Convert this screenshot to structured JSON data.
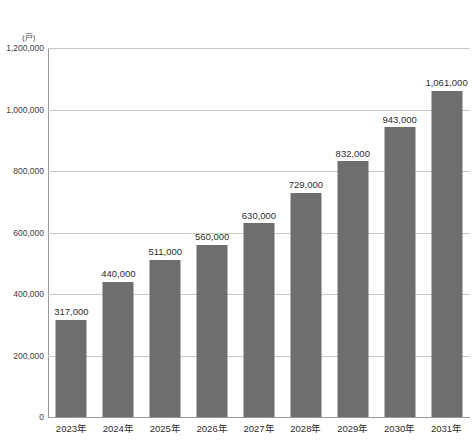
{
  "chart_data": {
    "type": "bar",
    "title": "",
    "subtitle": "",
    "xlabel": "",
    "ylabel": "",
    "unit_label": "(戸)",
    "categories": [
      "2023年",
      "2024年",
      "2025年",
      "2026年",
      "2027年",
      "2028年",
      "2029年",
      "2030年",
      "2031年"
    ],
    "values": [
      317000,
      440000,
      511000,
      560000,
      630000,
      729000,
      832000,
      943000,
      1061000
    ],
    "value_labels": [
      "317,000",
      "440,000",
      "511,000",
      "560,000",
      "630,000",
      "729,000",
      "832,000",
      "943,000",
      "1,061,000"
    ],
    "ylim": [
      0,
      1200000
    ],
    "ytick_values": [
      0,
      200000,
      400000,
      600000,
      800000,
      1000000,
      1200000
    ],
    "ytick_labels": [
      "0",
      "200,000",
      "400,000",
      "600,000",
      "800,000",
      "1,000,000",
      "1,200,000"
    ],
    "grid": true,
    "legend": null,
    "series_color": "#6e6e6e",
    "gridline_color": "#c8c8c8",
    "axis_color": "#9a9a9a",
    "text_color": "#2e2e2e"
  }
}
